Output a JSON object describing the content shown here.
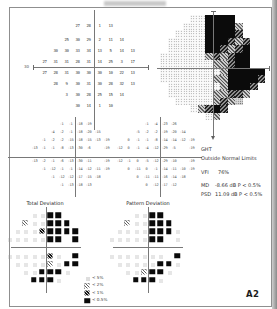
{
  "page": {
    "label": "A2"
  },
  "sections": {
    "total_deviation": "Total Deviation",
    "pattern_deviation": "Pattern Deviation"
  },
  "summary": {
    "ght_label": "GHT",
    "ght_value": "Outside Normal Limits",
    "vfi_label": "VFI",
    "vfi_value": "76%",
    "md_label": "MD",
    "md_value": "-8.66 dB P < 0.5%",
    "psd_label": "PSD",
    "psd_value": "11.09 dB P < 0.5%"
  },
  "axis_labels": {
    "left": "30"
  },
  "legend": [
    {
      "symbol": "p5",
      "label": "< 5%"
    },
    {
      "symbol": "p2",
      "label": "< 2%"
    },
    {
      "symbol": "p1",
      "label": "< 1%"
    },
    {
      "symbol": "p05",
      "label": "< 0.5%"
    }
  ],
  "chart_data": {
    "type": "visual-field-report",
    "threshold_grid": {
      "rows": [
        [
          27,
          28,
          1,
          13
        ],
        [
          25,
          30,
          29,
          2,
          11,
          14
        ],
        [
          30,
          30,
          33,
          34,
          13,
          5,
          14,
          13
        ],
        [
          27,
          31,
          31,
          28,
          31,
          14,
          25,
          3,
          17
        ],
        [
          27,
          28,
          31,
          30,
          30,
          30,
          10,
          22,
          13
        ],
        [
          28,
          9,
          30,
          31,
          30,
          28,
          32,
          13
        ],
        [
          3,
          30,
          28,
          25,
          15,
          14
        ],
        [
          30,
          14,
          1,
          10
        ]
      ]
    },
    "total_deviation_values": {
      "rows": [
        [
          -1,
          -1,
          -18,
          -19
        ],
        [
          -4,
          -2,
          -1,
          -18,
          -20,
          -15
        ],
        [
          -1,
          -2,
          -2,
          -15,
          -18,
          -15,
          -13,
          -19
        ],
        [
          -13,
          -1,
          -1,
          -8,
          -13,
          -30,
          -6,
          -19
        ],
        [
          -13,
          -2,
          -1,
          -6,
          -13,
          -30,
          -11,
          -19
        ],
        [
          -1,
          -12,
          -1,
          -1,
          -14,
          -12,
          -11,
          -19
        ],
        [
          -1,
          -12,
          -12,
          -17,
          -15,
          -18
        ],
        [
          -1,
          -13,
          -18,
          -13
        ]
      ]
    },
    "pattern_deviation_values": {
      "rows": [
        [
          -1,
          -4,
          -23,
          -26
        ],
        [
          -5,
          -2,
          -2,
          -19,
          -20,
          -14
        ],
        [
          0,
          -1,
          -1,
          -8,
          -14,
          -14,
          -12,
          -19
        ],
        [
          -12,
          0,
          -1,
          -4,
          -12,
          -29,
          -5,
          -19
        ],
        [
          -12,
          -1,
          0,
          -5,
          -12,
          -29,
          -10,
          -19
        ],
        [
          0,
          -11,
          0,
          -1,
          -14,
          -11,
          -10,
          -19
        ],
        [
          0,
          -11,
          -11,
          -16,
          -14,
          -18
        ],
        [
          0,
          -12,
          -17,
          -12
        ]
      ]
    },
    "total_deviation_prob": {
      "rows": [
        [
          "n",
          "n",
          "p05",
          "p05"
        ],
        [
          "p2",
          "n",
          "n",
          "p05",
          "p05",
          "p05"
        ],
        [
          "n",
          "n",
          "n",
          "p1",
          "p05",
          "p05",
          "p05",
          "p05"
        ],
        [
          "n",
          "n",
          "n",
          "n",
          "n",
          "p05",
          "p05",
          "p05"
        ],
        [
          "n",
          "n",
          "n",
          "n",
          "n",
          "p1",
          "n",
          "p05"
        ],
        [
          "n",
          "n",
          "n",
          "n",
          "p2",
          "n",
          "p05",
          "p05"
        ],
        [
          "n",
          "n",
          "p05",
          "p05",
          "p05",
          "n"
        ],
        [
          "p05",
          "p05",
          "p05",
          "n"
        ]
      ]
    },
    "pattern_deviation_prob": {
      "rows": [
        [
          "n",
          "n",
          "p05",
          "p05"
        ],
        [
          "p2",
          "n",
          "n",
          "p05",
          "p05",
          "p05"
        ],
        [
          "n",
          "n",
          "n",
          "n",
          "p05",
          "p05",
          "p05",
          "n"
        ],
        [
          "n",
          "n",
          "n",
          "n",
          "n",
          "p05",
          "p05",
          "n"
        ],
        [
          "n",
          "n",
          "n",
          "n",
          "n",
          "n",
          "n",
          "p05"
        ],
        [
          "n",
          "n",
          "n",
          "n",
          "n",
          "p05",
          "p05",
          "n"
        ],
        [
          "n",
          "n",
          "p2",
          "p05",
          "p05",
          "n"
        ],
        [
          "p05",
          "p05",
          "p05",
          "n"
        ]
      ]
    },
    "grayscale_map": [
      "....llkkkk....",
      "...lllkkkkm...",
      "..llllkkkkd...",
      ".lllllkkkdmd..",
      ".lllllkkdmdk..",
      "llllllmdmdkk..",
      "lllllllmmdkk..",
      "llllllllmkkkkk",
      "lllllllmmkkkkd",
      ".lllllllmkkkd.",
      ".llllllmmddm..",
      "..lllllmdmg...",
      "....lmdkd.....",
      "......lm......"
    ]
  }
}
